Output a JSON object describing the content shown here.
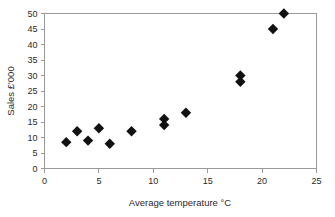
{
  "chart_data": {
    "type": "scatter",
    "title": "",
    "xlabel": "Average temperature °C",
    "ylabel": "Sales £'000",
    "xlim": [
      0,
      25
    ],
    "ylim": [
      0,
      50
    ],
    "xticks": [
      0,
      5,
      10,
      15,
      20,
      25
    ],
    "yticks": [
      0,
      5,
      10,
      15,
      20,
      25,
      30,
      35,
      40,
      45,
      50
    ],
    "grid": false,
    "legend": null,
    "marker": "diamond",
    "marker_color": "#111111",
    "frame_color": "#9a9a9a",
    "points": [
      {
        "x": 2,
        "y": 8.5
      },
      {
        "x": 3,
        "y": 12
      },
      {
        "x": 4,
        "y": 9
      },
      {
        "x": 5,
        "y": 13
      },
      {
        "x": 6,
        "y": 8
      },
      {
        "x": 8,
        "y": 12
      },
      {
        "x": 11,
        "y": 16
      },
      {
        "x": 11,
        "y": 14
      },
      {
        "x": 13,
        "y": 18
      },
      {
        "x": 18,
        "y": 30
      },
      {
        "x": 18,
        "y": 28
      },
      {
        "x": 21,
        "y": 45
      },
      {
        "x": 22,
        "y": 50
      }
    ],
    "x": [
      2,
      3,
      4,
      5,
      6,
      8,
      11,
      11,
      13,
      18,
      18,
      21,
      22
    ],
    "values": [
      8.5,
      12,
      9,
      13,
      8,
      12,
      16,
      14,
      18,
      30,
      28,
      45,
      50
    ]
  }
}
